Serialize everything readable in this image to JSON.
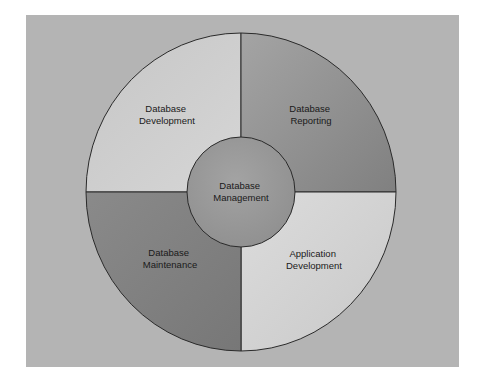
{
  "diagram": {
    "type": "circular-segment-diagram",
    "center": {
      "label_line1": "Database",
      "label_line2": "Management",
      "color": "#999999"
    },
    "segments": [
      {
        "id": "top-left",
        "label_line1": "Database",
        "label_line2": "Development",
        "color": "#cfcfcf"
      },
      {
        "id": "top-right",
        "label_line1": "Database",
        "label_line2": "Reporting",
        "color": "#8f8f8f"
      },
      {
        "id": "bottom-left",
        "label_line1": "Database",
        "label_line2": "Maintenance",
        "color": "#838383"
      },
      {
        "id": "bottom-right",
        "label_line1": "Application",
        "label_line2": "Development",
        "color": "#d6d6d6"
      }
    ],
    "background_color": "#b4b4b4",
    "outline_color": "#2a2a2a"
  }
}
